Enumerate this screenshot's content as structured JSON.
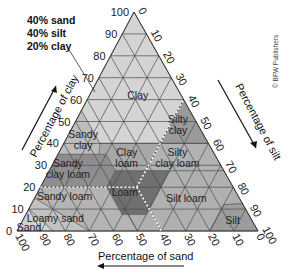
{
  "annotation": {
    "lines": [
      "40% sand",
      "40% silt",
      "20% clay"
    ]
  },
  "credit": "© BFW Publishers",
  "axes": {
    "clay": {
      "title": "Percentage of clay",
      "ticks": [
        "0",
        "10",
        "20",
        "30",
        "40",
        "50",
        "60",
        "70",
        "80",
        "90",
        "100"
      ]
    },
    "silt": {
      "title": "Percentage of silt",
      "ticks": [
        "0",
        "10",
        "20",
        "30",
        "40",
        "50",
        "60",
        "70",
        "80",
        "90",
        "100"
      ]
    },
    "sand": {
      "title": "Percentage of sand",
      "ticks": [
        "100",
        "90",
        "80",
        "70",
        "60",
        "50",
        "40",
        "30",
        "20",
        "10",
        "0"
      ]
    }
  },
  "regions": {
    "clay": "Clay",
    "sandy_clay": [
      "Sandy",
      "clay"
    ],
    "silty_clay": [
      "Silty",
      "clay"
    ],
    "clay_loam": [
      "Clay",
      "loam"
    ],
    "silty_clay_loam": [
      "Silty",
      "clay loam"
    ],
    "sandy_clay_loam": [
      "Sandy",
      "clay loam"
    ],
    "loam": "Loam",
    "sandy_loam": "Sandy loam",
    "silt_loam": "Silt loam",
    "loamy_sand": "Loamy sand",
    "sand": "Sand",
    "silt": "Silt"
  },
  "colors": {
    "clay": "#d4d4d4",
    "sandy_clay": "#bdbdbd",
    "silty_clay": "#9a9a9a",
    "clay_loam": "#a8a8a8",
    "silty_clay_loam": "#b2b2b2",
    "sandy_clay_loam": "#8e8e8e",
    "loam": "#707070",
    "sandy_loam": "#b4b4b4",
    "silt_loam": "#b0b0b0",
    "loamy_sand": "#c2c2c2",
    "sand": "#d0d0d0",
    "silt": "#9c9c9c",
    "grid": "#4a4a4a",
    "dotted": "#ffffff"
  },
  "chart_data": {
    "type": "ternary",
    "axes": [
      "Percentage of clay",
      "Percentage of silt",
      "Percentage of sand"
    ],
    "example_point": {
      "sand": 40,
      "silt": 40,
      "clay": 20,
      "class": "Loam"
    },
    "classes": [
      "Clay",
      "Sandy clay",
      "Silty clay",
      "Clay loam",
      "Silty clay loam",
      "Sandy clay loam",
      "Loam",
      "Sandy loam",
      "Silt loam",
      "Loamy sand",
      "Sand",
      "Silt"
    ]
  }
}
